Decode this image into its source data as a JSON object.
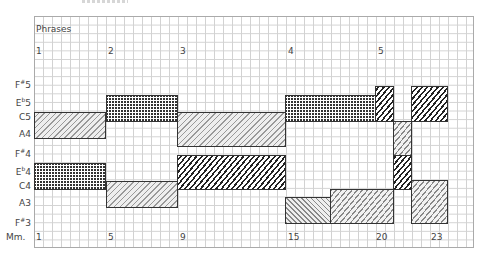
{
  "diagram": {
    "phrases_label": "Phrases",
    "measures_label": "Mm.",
    "phrases": [
      {
        "label": "1",
        "x": 36
      },
      {
        "label": "2",
        "x": 108
      },
      {
        "label": "3",
        "x": 180
      },
      {
        "label": "4",
        "x": 288
      },
      {
        "label": "5",
        "x": 378
      }
    ],
    "measures": [
      {
        "label": "1",
        "x": 36
      },
      {
        "label": "5",
        "x": 108
      },
      {
        "label": "9",
        "x": 180
      },
      {
        "label": "15",
        "x": 288
      },
      {
        "label": "20",
        "x": 376
      },
      {
        "label": "23",
        "x": 431
      }
    ],
    "pitches": [
      {
        "name": "F",
        "acc": "#",
        "oct": "5",
        "y": 77
      },
      {
        "name": "E",
        "acc": "b",
        "oct": "5",
        "y": 95
      },
      {
        "name": "C",
        "acc": "",
        "oct": "5",
        "y": 112
      },
      {
        "name": "A",
        "acc": "",
        "oct": "4",
        "y": 129
      },
      {
        "name": "F",
        "acc": "#",
        "oct": "4",
        "y": 146
      },
      {
        "name": "E",
        "acc": "b",
        "oct": "4",
        "y": 164
      },
      {
        "name": "C",
        "acc": "",
        "oct": "4",
        "y": 181
      },
      {
        "name": "A",
        "acc": "",
        "oct": "3",
        "y": 198
      },
      {
        "name": "F",
        "acc": "#",
        "oct": "3",
        "y": 215
      }
    ],
    "boxes": [
      {
        "pattern": "diag",
        "x": 34,
        "y": 112,
        "w": 72,
        "h": 27
      },
      {
        "pattern": "cross",
        "x": 34,
        "y": 163,
        "w": 72,
        "h": 27
      },
      {
        "pattern": "cross",
        "x": 106,
        "y": 95,
        "w": 72,
        "h": 27
      },
      {
        "pattern": "diag",
        "x": 106,
        "y": 181,
        "w": 72,
        "h": 27
      },
      {
        "pattern": "diag",
        "x": 177,
        "y": 112,
        "w": 109,
        "h": 35
      },
      {
        "pattern": "wavydark",
        "x": 177,
        "y": 155,
        "w": 109,
        "h": 35
      },
      {
        "pattern": "cross",
        "x": 285,
        "y": 95,
        "w": 91,
        "h": 27
      },
      {
        "pattern": "wavydark",
        "x": 375,
        "y": 86,
        "w": 19,
        "h": 36
      },
      {
        "pattern": "wavydark",
        "x": 411,
        "y": 86,
        "w": 37,
        "h": 36
      },
      {
        "pattern": "wavylight",
        "x": 393,
        "y": 121,
        "w": 19,
        "h": 35
      },
      {
        "pattern": "wavydark",
        "x": 393,
        "y": 155,
        "w": 19,
        "h": 35
      },
      {
        "pattern": "backdiag",
        "x": 285,
        "y": 197,
        "w": 46,
        "h": 27
      },
      {
        "pattern": "wavylight",
        "x": 330,
        "y": 189,
        "w": 64,
        "h": 35
      },
      {
        "pattern": "wavylight",
        "x": 411,
        "y": 180,
        "w": 37,
        "h": 44
      }
    ]
  }
}
